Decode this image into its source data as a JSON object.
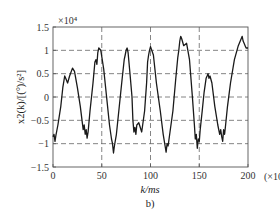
{
  "chart_data": {
    "type": "line",
    "title": "",
    "subtitle": "b)",
    "xlabel": "k/ms",
    "ylabel": "x2(k)/[(°)/s²]",
    "y_multiplier": "×10⁴",
    "x_multiplier": "(×10)",
    "xlim": [
      0,
      200
    ],
    "ylim": [
      -1.5,
      1.5
    ],
    "x_ticks": [
      0,
      50,
      100,
      150,
      200
    ],
    "x_tick_labels": [
      "0",
      "50",
      "100",
      "150",
      "200"
    ],
    "y_ticks": [
      -1.5,
      -1,
      -0.5,
      0,
      0.5,
      1,
      1.5
    ],
    "y_tick_labels": [
      "-1.5",
      "-1",
      "-0.5",
      "0",
      "0.5",
      "1",
      "1.5"
    ],
    "grid": true,
    "grid_style": "dashed",
    "legend": null,
    "series": [
      {
        "name": "x2(k)",
        "color": "#1a1a1a",
        "x": [
          0,
          1,
          2,
          3,
          5,
          8,
          10,
          12,
          13,
          15,
          17,
          20,
          22,
          25,
          28,
          30,
          31,
          32,
          33,
          34,
          35,
          36,
          38,
          41,
          43,
          44,
          45,
          46,
          47,
          49,
          52,
          55,
          58,
          60,
          61,
          62,
          63,
          65,
          68,
          71,
          73,
          74,
          75,
          76,
          77,
          79,
          81,
          82,
          83,
          84,
          85,
          86,
          88,
          91,
          94,
          96,
          97,
          98,
          99,
          100,
          103,
          106,
          110,
          113,
          115,
          116,
          117,
          118,
          120,
          123,
          126,
          128,
          129,
          130,
          131,
          132,
          134,
          137,
          140,
          143,
          145,
          146,
          147,
          148,
          149,
          150,
          151,
          153,
          155,
          157,
          158,
          159,
          160,
          161,
          163,
          166,
          169,
          171,
          172,
          173,
          174,
          175,
          176,
          177,
          179,
          182,
          186,
          190,
          193,
          194,
          195,
          196,
          197,
          198,
          200
        ],
        "values": [
          -0.85,
          -0.8,
          -0.95,
          -0.82,
          -0.6,
          -0.2,
          0.2,
          0.45,
          0.4,
          0.3,
          0.45,
          0.62,
          0.55,
          0.2,
          -0.2,
          -0.55,
          -0.7,
          -0.6,
          -0.8,
          -0.7,
          -0.88,
          -0.75,
          -0.3,
          0.3,
          0.75,
          0.8,
          0.7,
          0.95,
          1.05,
          1.0,
          0.6,
          0.0,
          -0.6,
          -0.9,
          -1.0,
          -1.2,
          -1.05,
          -0.8,
          -0.2,
          0.4,
          0.8,
          0.9,
          1.0,
          1.05,
          0.95,
          0.5,
          0.0,
          -0.5,
          -0.75,
          -0.65,
          -0.8,
          -0.6,
          -0.55,
          -0.75,
          -0.3,
          0.3,
          0.75,
          0.9,
          1.0,
          1.08,
          0.9,
          0.3,
          -0.3,
          -0.8,
          -1.05,
          -1.18,
          -1.0,
          -1.05,
          -0.75,
          -0.3,
          0.4,
          0.85,
          1.0,
          1.2,
          1.3,
          1.25,
          1.1,
          1.15,
          0.8,
          0.0,
          -0.6,
          -0.9,
          -0.8,
          -1.1,
          -0.9,
          -0.95,
          -0.7,
          -0.3,
          0.1,
          0.4,
          0.45,
          0.5,
          0.4,
          0.45,
          0.3,
          -0.2,
          -0.6,
          -0.8,
          -0.7,
          -0.85,
          -0.95,
          -0.7,
          -0.8,
          -0.6,
          -0.2,
          0.3,
          0.8,
          1.1,
          1.25,
          1.3,
          1.2,
          1.15,
          1.1,
          1.05,
          1.05
        ]
      }
    ]
  }
}
